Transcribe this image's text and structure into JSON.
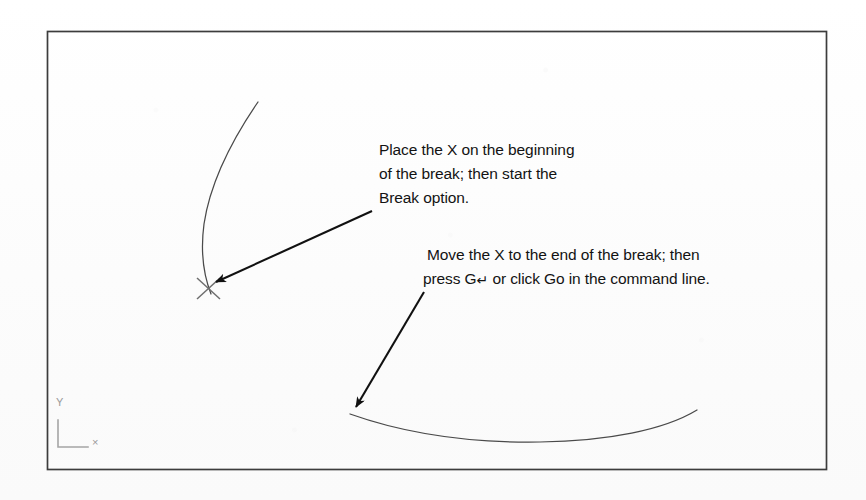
{
  "figure": {
    "background_color": "#fdfdfd",
    "frame": {
      "name": "drawing-border",
      "color": "#3c3c3c",
      "x": 47,
      "y": 31,
      "width": 780,
      "height": 439
    }
  },
  "callouts": [
    {
      "id": "break-start",
      "lines": [
        "Place the X on the beginning",
        "of the break; then start the",
        "Break option."
      ]
    },
    {
      "id": "break-end",
      "lines": [
        "Move the X to the end of the break; then",
        "press G↵ or click Go in the command line."
      ],
      "line2_prefix": "press G",
      "line2_key": "↵",
      "line2_suffix": " or click Go in the command line."
    }
  ],
  "markers": {
    "x_marker": {
      "label": "X",
      "color": "#6e6e6e",
      "center_x": 208,
      "center_y": 288
    }
  },
  "geometry": {
    "upper_arc": {
      "name": "upper-broken-arc",
      "color": "#4a4a4a",
      "start_x": 258,
      "start_y": 102,
      "end_x": 211,
      "end_y": 294
    },
    "lower_arc": {
      "name": "lower-broken-arc",
      "color": "#4a4a4a",
      "start_x": 350,
      "start_y": 414,
      "end_x": 697,
      "end_y": 410
    }
  },
  "leaders": [
    {
      "id": "leader-to-x-marker",
      "from_x": 372,
      "from_y": 211,
      "to_x": 216,
      "to_y": 282,
      "color": "#111111"
    },
    {
      "id": "leader-to-lower-arc",
      "from_x": 424,
      "from_y": 292,
      "to_x": 356,
      "to_y": 407,
      "color": "#111111"
    }
  ],
  "ucs_icon": {
    "name": "ucs-axis-icon",
    "color": "#a5a5a5",
    "y_axis_label": "Y",
    "x_axis_label": "×",
    "origin_x": 58,
    "origin_y": 447,
    "y_arm_top": 420,
    "x_arm_right": 88
  }
}
